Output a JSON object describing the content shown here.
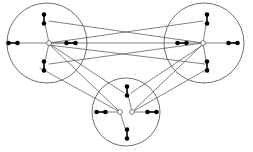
{
  "figure": {
    "title": "",
    "caption": "",
    "type": "graph-diagram",
    "background_color": "#ffffff",
    "stroke_color": "#4a4a4a",
    "node_fill_color": "#000000",
    "hub_fill_color": "#ffffff",
    "circle_stroke_width": 0.8,
    "edge_stroke_width": 0.7,
    "dumbbell": {
      "dot_radius": 2.3,
      "bar_length": 9,
      "bar_width": 1.6
    },
    "hub_radius": 2.4
  },
  "clusters": [
    {
      "id": "left-cluster",
      "label": "",
      "center": {
        "x": 47,
        "y": 43
      },
      "radius": 40,
      "hubs": [
        {
          "id": "left-hub",
          "x": 49,
          "y": 43
        }
      ],
      "nodes": [
        {
          "id": "left-node-top",
          "position": "top",
          "x": 44,
          "y": 19,
          "angle": -90
        },
        {
          "id": "left-node-bottom",
          "position": "bottom",
          "x": 44,
          "y": 66,
          "angle": 90
        },
        {
          "id": "left-node-left",
          "position": "left",
          "x": 13,
          "y": 43,
          "angle": 180
        },
        {
          "id": "left-node-right",
          "position": "right",
          "x": 71,
          "y": 43,
          "angle": 0
        }
      ]
    },
    {
      "id": "right-cluster",
      "label": "",
      "center": {
        "x": 204,
        "y": 43
      },
      "radius": 40,
      "hubs": [
        {
          "id": "right-hub",
          "x": 203,
          "y": 43
        }
      ],
      "nodes": [
        {
          "id": "right-node-top",
          "position": "top",
          "x": 207,
          "y": 19,
          "angle": -90
        },
        {
          "id": "right-node-bottom",
          "position": "bottom",
          "x": 207,
          "y": 66,
          "angle": 90
        },
        {
          "id": "right-node-left",
          "position": "left",
          "x": 182,
          "y": 43,
          "angle": 180
        },
        {
          "id": "right-node-right",
          "position": "right",
          "x": 233,
          "y": 43,
          "angle": 0
        }
      ]
    },
    {
      "id": "bottom-cluster",
      "label": "",
      "center": {
        "x": 126,
        "y": 112
      },
      "radius": 34,
      "hubs": [
        {
          "id": "bottom-hub-left",
          "x": 120,
          "y": 112
        },
        {
          "id": "bottom-hub-right",
          "x": 132,
          "y": 112
        }
      ],
      "nodes": [
        {
          "id": "bottom-node-top",
          "position": "top",
          "x": 127,
          "y": 91,
          "angle": -90
        },
        {
          "id": "bottom-node-bottom",
          "position": "bottom",
          "x": 127,
          "y": 134,
          "angle": 90
        },
        {
          "id": "bottom-node-left",
          "position": "left",
          "x": 101,
          "y": 112,
          "angle": 180
        },
        {
          "id": "bottom-node-right",
          "position": "right",
          "x": 152,
          "y": 112,
          "angle": 0
        }
      ]
    }
  ],
  "inner_spokes": [
    {
      "id": "spoke-left-top",
      "from": "left-hub",
      "to": "left-node-top"
    },
    {
      "id": "spoke-left-bottom",
      "from": "left-hub",
      "to": "left-node-bottom"
    },
    {
      "id": "spoke-left-left",
      "from": "left-hub",
      "to": "left-node-left"
    },
    {
      "id": "spoke-left-right",
      "from": "left-hub",
      "to": "left-node-right"
    },
    {
      "id": "spoke-right-top",
      "from": "right-hub",
      "to": "right-node-top"
    },
    {
      "id": "spoke-right-bottom",
      "from": "right-hub",
      "to": "right-node-bottom"
    },
    {
      "id": "spoke-right-left",
      "from": "right-hub",
      "to": "right-node-left"
    },
    {
      "id": "spoke-right-right",
      "from": "right-hub",
      "to": "right-node-right"
    },
    {
      "id": "spoke-bottom-top",
      "from": "bottom-hub-right",
      "to": "bottom-node-top"
    },
    {
      "id": "spoke-bottom-bot",
      "from": "bottom-hub-left",
      "to": "bottom-node-bottom"
    },
    {
      "id": "spoke-bottom-left",
      "from": "bottom-hub-left",
      "to": "bottom-node-left"
    },
    {
      "id": "spoke-bottom-right",
      "from": "bottom-hub-right",
      "to": "bottom-node-right"
    }
  ],
  "cross_edges": [
    {
      "id": "edge-lh-rnl",
      "from": "left-hub",
      "to": "right-node-left",
      "x1": 49,
      "y1": 43,
      "x2": 182,
      "y2": 43
    },
    {
      "id": "edge-lnt-rh",
      "from": "left-node-top",
      "to": "right-hub",
      "x1": 49,
      "y1": 21,
      "x2": 203,
      "y2": 43
    },
    {
      "id": "edge-lh-rnt",
      "from": "left-hub",
      "to": "right-node-top",
      "x1": 49,
      "y1": 43,
      "x2": 203,
      "y2": 21
    },
    {
      "id": "edge-lnb-rh",
      "from": "left-node-bottom",
      "to": "right-hub",
      "x1": 49,
      "y1": 64,
      "x2": 203,
      "y2": 43
    },
    {
      "id": "edge-lh-rnb",
      "from": "left-hub",
      "to": "right-node-bottom",
      "x1": 49,
      "y1": 45,
      "x2": 205,
      "y2": 64
    },
    {
      "id": "edge-lnb-bh",
      "from": "left-node-bottom",
      "to": "bottom-hub-left",
      "x1": 40,
      "y1": 68,
      "x2": 120,
      "y2": 112
    },
    {
      "id": "edge-lh-bnt",
      "from": "left-hub",
      "to": "bottom-node-top",
      "x1": 51,
      "y1": 45,
      "x2": 124,
      "y2": 93
    },
    {
      "id": "edge-bh-rnb",
      "from": "bottom-hub-right",
      "to": "right-node-bottom",
      "x1": 132,
      "y1": 112,
      "x2": 209,
      "y2": 68
    },
    {
      "id": "edge-bnt-rh",
      "from": "bottom-node-top",
      "to": "right-hub",
      "x1": 131,
      "y1": 93,
      "x2": 203,
      "y2": 45
    },
    {
      "id": "edge-lh-bhl",
      "from": "left-hub",
      "to": "bottom-hub-left",
      "x1": 51,
      "y1": 46,
      "x2": 118,
      "y2": 110
    },
    {
      "id": "edge-bhr-rh",
      "from": "bottom-hub-right",
      "to": "right-hub",
      "x1": 134,
      "y1": 110,
      "x2": 201,
      "y2": 46
    }
  ]
}
